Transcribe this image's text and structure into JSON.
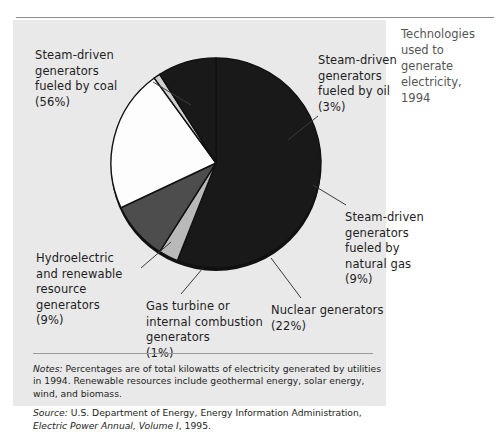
{
  "side_caption": "Technologies\nused to\ngenerate\nelectricity,\n1994",
  "labels": {
    "coal": "Steam-driven\ngenerators\nfueled by coal\n(56%)",
    "oil": "Steam-driven\ngenerators\nfueled by oil\n(3%)",
    "natural_gas": "Steam-driven\ngenerators\nfueled by\nnatural gas\n(9%)",
    "nuclear": "Nuclear generators\n(22%)",
    "gas_turbine": "Gas turbine or\ninternal combustion\ngenerators\n(1%)",
    "hydro": "Hydroelectric\nand renewable\nresource\ngenerators\n(9%)"
  },
  "notes": {
    "notes_lead": "Notes:",
    "notes_text": " Percentages are of total kilowatts of electricity generated by utilities in 1994. Renewable resources include geothermal energy, solar energy, wind, and biomass.",
    "source_lead": "Source:",
    "source_text": " U.S. Department of Energy, Energy Information Administration, ",
    "source_title": "Electric Power Annual, Volume I",
    "source_tail": ", 1995."
  },
  "colors": {
    "panel_background": "#e9e9e9",
    "page_background": "#ffffff",
    "coal": "#191919",
    "oil": "#b9b9b9",
    "natural_gas": "#4d4d4d",
    "nuclear": "#fdfdfd",
    "gas_turbine": "#cfcfcf",
    "hydro": "#191919",
    "slice_outline": "#111111",
    "rule": "#8d8d8d",
    "text": "#1d1d1d",
    "caption_text": "#555555"
  },
  "chart_data": {
    "type": "pie",
    "title": "Technologies used to generate electricity, 1994",
    "categories": [
      "Steam-driven generators fueled by coal",
      "Steam-driven generators fueled by oil",
      "Steam-driven generators fueled by natural gas",
      "Nuclear generators",
      "Gas turbine or internal combustion generators",
      "Hydroelectric and renewable resource generators"
    ],
    "values": [
      56,
      3,
      9,
      22,
      1,
      9
    ],
    "unit": "percent",
    "slice_colors": [
      "#191919",
      "#b9b9b9",
      "#4d4d4d",
      "#fdfdfd",
      "#cfcfcf",
      "#191919"
    ],
    "legend": "none (direct labels with leader lines)",
    "grid": false,
    "xlabel": "",
    "ylabel": "",
    "start_angle_deg": -90,
    "direction": "clockwise"
  }
}
